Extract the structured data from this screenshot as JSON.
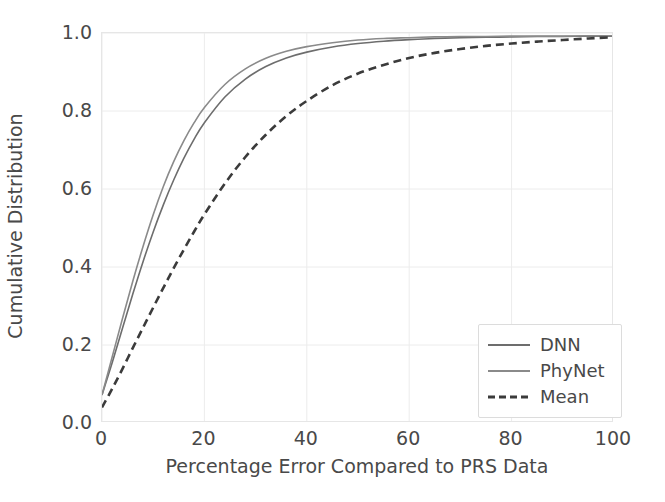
{
  "chart_data": {
    "type": "line",
    "title": "",
    "xlabel": "Percentage Error Compared to PRS Data",
    "ylabel": "Cumulative Distribution",
    "xlim": [
      0,
      100
    ],
    "ylim": [
      0.0,
      1.0
    ],
    "grid": true,
    "legend_position": "lower right",
    "xticks": [
      "0",
      "20",
      "40",
      "60",
      "80",
      "100"
    ],
    "xtick_values": [
      0,
      20,
      40,
      60,
      80,
      100
    ],
    "yticks": [
      "0.0",
      "0.2",
      "0.4",
      "0.6",
      "0.8",
      "1.0"
    ],
    "ytick_values": [
      0.0,
      0.2,
      0.4,
      0.6,
      0.8,
      1.0
    ],
    "x": [
      0,
      2,
      4,
      6,
      8,
      10,
      12,
      14,
      16,
      18,
      20,
      24,
      28,
      32,
      36,
      40,
      45,
      50,
      55,
      60,
      65,
      70,
      75,
      80,
      85,
      90,
      95,
      100
    ],
    "series": [
      {
        "name": "DNN",
        "color": "#6d6d6d",
        "style": "solid",
        "linewidth": 1.6,
        "values": [
          0.072,
          0.155,
          0.243,
          0.33,
          0.413,
          0.49,
          0.56,
          0.623,
          0.679,
          0.728,
          0.77,
          0.836,
          0.882,
          0.914,
          0.936,
          0.951,
          0.964,
          0.973,
          0.979,
          0.983,
          0.986,
          0.988,
          0.989,
          0.99,
          0.991,
          0.991,
          0.992,
          0.992
        ]
      },
      {
        "name": "PhyNet",
        "color": "#8a8a8a",
        "style": "solid",
        "linewidth": 1.6,
        "values": [
          0.072,
          0.17,
          0.268,
          0.363,
          0.452,
          0.534,
          0.607,
          0.67,
          0.724,
          0.77,
          0.809,
          0.868,
          0.908,
          0.935,
          0.953,
          0.965,
          0.975,
          0.982,
          0.986,
          0.988,
          0.99,
          0.991,
          0.991,
          0.992,
          0.992,
          0.992,
          0.993,
          0.993
        ]
      },
      {
        "name": "Mean",
        "color": "#3b3b3b",
        "style": "dashed",
        "linewidth": 2.6,
        "values": [
          0.04,
          0.088,
          0.139,
          0.192,
          0.244,
          0.296,
          0.347,
          0.397,
          0.445,
          0.491,
          0.535,
          0.614,
          0.682,
          0.739,
          0.787,
          0.826,
          0.866,
          0.896,
          0.918,
          0.936,
          0.949,
          0.959,
          0.967,
          0.973,
          0.978,
          0.982,
          0.986,
          0.989
        ]
      }
    ]
  },
  "legend": {
    "items": [
      {
        "label": "DNN"
      },
      {
        "label": "PhyNet"
      },
      {
        "label": "Mean"
      }
    ]
  },
  "style": {
    "grid_color": "#ececec",
    "axis_color": "#e6e6e6",
    "text_color": "#494949",
    "background": "#ffffff"
  }
}
